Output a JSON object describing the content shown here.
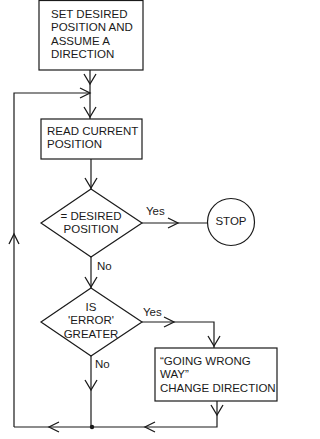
{
  "diagram": {
    "type": "flowchart",
    "nodes": [
      {
        "id": "start",
        "shape": "rect",
        "lines": [
          "SET DESIRED",
          "POSITION AND",
          "ASSUME A",
          "DIRECTION"
        ]
      },
      {
        "id": "read",
        "shape": "rect",
        "lines": [
          "READ CURRENT",
          "POSITION"
        ]
      },
      {
        "id": "check_desired",
        "shape": "diamond",
        "lines": [
          "= DESIRED",
          "POSITION"
        ]
      },
      {
        "id": "stop",
        "shape": "circle",
        "lines": [
          "STOP"
        ]
      },
      {
        "id": "check_error",
        "shape": "diamond",
        "lines": [
          "IS",
          "'ERROR'",
          "GREATER"
        ]
      },
      {
        "id": "change_dir",
        "shape": "rect",
        "lines": [
          "“GOING WRONG",
          "WAY”",
          "CHANGE DIRECTION"
        ]
      }
    ],
    "edges": [
      {
        "from": "start",
        "to": "read",
        "label": ""
      },
      {
        "from": "read",
        "to": "check_desired",
        "label": ""
      },
      {
        "from": "check_desired",
        "to": "stop",
        "label": "Yes"
      },
      {
        "from": "check_desired",
        "to": "check_error",
        "label": "No"
      },
      {
        "from": "check_error",
        "to": "change_dir",
        "label": "Yes"
      },
      {
        "from": "check_error",
        "to": "read",
        "label": "No"
      },
      {
        "from": "change_dir",
        "to": "read",
        "label": ""
      }
    ]
  },
  "labels": {
    "yes1": "Yes",
    "no1": "No",
    "yes2": "Yes",
    "no2": "No"
  },
  "colors": {
    "stroke": "#1a1a1a",
    "background": "#ffffff"
  }
}
